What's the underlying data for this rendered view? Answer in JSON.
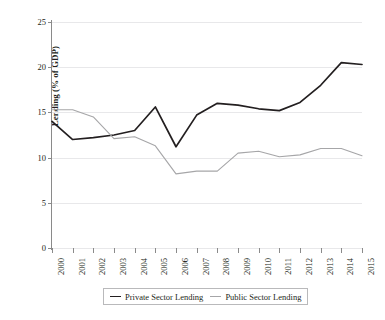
{
  "chart_data": {
    "type": "line",
    "title": "",
    "subtitle": "",
    "xlabel": "",
    "ylabel": "Lending (% of GDP)",
    "categories": [
      "2000",
      "2001",
      "2002",
      "2003",
      "2004",
      "2005",
      "2006",
      "2007",
      "2008",
      "2009",
      "2010",
      "2011",
      "2012",
      "2013",
      "2014",
      "2015"
    ],
    "x": [
      2000,
      2001,
      2002,
      2003,
      2004,
      2005,
      2006,
      2007,
      2008,
      2009,
      2010,
      2011,
      2012,
      2013,
      2014,
      2015
    ],
    "ylim": [
      0,
      25
    ],
    "yticks": [
      0,
      5,
      10,
      15,
      20,
      25
    ],
    "ytick_labels": [
      "0",
      "5",
      "10",
      "15",
      "20",
      "25"
    ],
    "grid": true,
    "grid_axis": "y",
    "legend_position": "bottom",
    "series": [
      {
        "name": "Private Sector Lending",
        "color": "#231f20",
        "width": 1.7,
        "values": [
          14.0,
          12.0,
          12.2,
          12.5,
          13.0,
          15.6,
          11.2,
          14.7,
          16.0,
          15.8,
          15.4,
          15.2,
          16.1,
          18.0,
          20.5,
          20.3
        ]
      },
      {
        "name": "Public Sector Lending",
        "color": "#a6a6a8",
        "width": 1.1,
        "values": [
          15.3,
          15.3,
          14.5,
          12.1,
          12.3,
          11.3,
          8.2,
          8.5,
          8.5,
          10.5,
          10.7,
          10.1,
          10.3,
          11.0,
          11.0,
          10.2
        ]
      }
    ]
  },
  "legend": {
    "items": [
      {
        "label": "Private Sector Lending"
      },
      {
        "label": "Public Sector Lending"
      }
    ]
  },
  "colors": {
    "private": "#231f20",
    "public": "#a6a6a8",
    "axis": "#8a8a8a",
    "grid": "#e8e8ea",
    "text": "#231f20"
  }
}
